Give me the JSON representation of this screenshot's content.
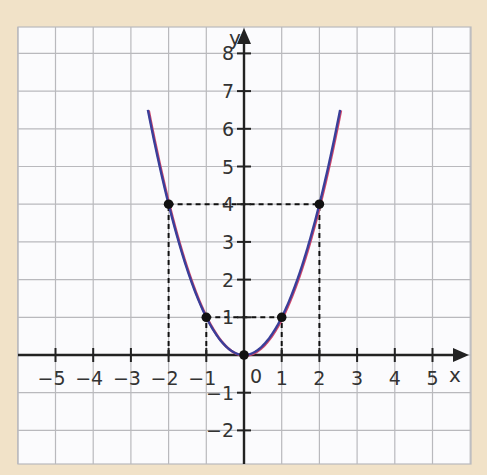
{
  "chart_data": {
    "type": "line",
    "title": "",
    "function": "y = x^2",
    "xlabel": "x",
    "ylabel": "y",
    "xlim": [
      -5.9,
      6.1
    ],
    "ylim": [
      -2.9,
      8.7
    ],
    "grid": true,
    "x_ticks": [
      -5,
      -4,
      -3,
      -2,
      -1,
      1,
      2,
      3,
      4,
      5
    ],
    "x_tick_labels": [
      "−5",
      "−4",
      "−3",
      "−2",
      "−1",
      "1",
      "2",
      "3",
      "4",
      "5"
    ],
    "y_ticks": [
      -2,
      -1,
      1,
      2,
      3,
      4,
      5,
      6,
      7,
      8
    ],
    "y_tick_labels": [
      "−2",
      "−1",
      "1",
      "2",
      "3",
      "4",
      "5",
      "6",
      "7",
      "8"
    ],
    "origin_label": "0",
    "curve_domain": [
      -2.55,
      2.55
    ],
    "series": [
      {
        "name": "parabola",
        "x": [
          -2.55,
          -2,
          -1,
          0,
          1,
          2,
          2.55
        ],
        "y": [
          6.5,
          4,
          1,
          0,
          1,
          4,
          6.5
        ]
      }
    ],
    "marked_points": [
      {
        "x": -2,
        "y": 4
      },
      {
        "x": -1,
        "y": 1
      },
      {
        "x": 0,
        "y": 0
      },
      {
        "x": 1,
        "y": 1
      },
      {
        "x": 2,
        "y": 4
      }
    ],
    "dashed_guides": [
      {
        "from": [
          -2,
          0
        ],
        "to": [
          -2,
          4
        ]
      },
      {
        "from": [
          -2,
          4
        ],
        "to": [
          2,
          4
        ]
      },
      {
        "from": [
          2,
          0
        ],
        "to": [
          2,
          4
        ]
      },
      {
        "from": [
          -1,
          0
        ],
        "to": [
          -1,
          1
        ]
      },
      {
        "from": [
          -1,
          1
        ],
        "to": [
          1,
          1
        ]
      },
      {
        "from": [
          1,
          0
        ],
        "to": [
          1,
          1
        ]
      }
    ]
  },
  "colors": {
    "background": "#f1e2c8",
    "paper": "#fbfbfd",
    "grid": "#b9b9bd",
    "axis": "#222222",
    "curve": "#3a3f9a",
    "curve_shadow": "#d0466a",
    "point": "#111111"
  },
  "layout": {
    "origin_px": [
      244,
      355
    ],
    "unit_px": 37.7,
    "paper_rect": [
      18,
      27,
      471,
      464
    ]
  }
}
